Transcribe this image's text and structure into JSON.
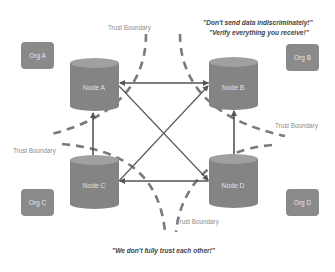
{
  "colors": {
    "node_body": "#848484",
    "node_top": "#a0a0a0",
    "org_fill": "#8a8a8a",
    "arrow": "#555555",
    "boundary_dash": "#7a7a7a",
    "label_text": "#8c8c8c",
    "quote_text": "#444444"
  },
  "nodes": [
    {
      "id": "A",
      "label": "Node A"
    },
    {
      "id": "B",
      "label": "Node B"
    },
    {
      "id": "C",
      "label": "Node C"
    },
    {
      "id": "D",
      "label": "Node D"
    }
  ],
  "orgs": [
    {
      "id": "A",
      "label": "Org A"
    },
    {
      "id": "B",
      "label": "Org B"
    },
    {
      "id": "C",
      "label": "Org C"
    },
    {
      "id": "D",
      "label": "Org D"
    }
  ],
  "boundaries": [
    {
      "position": "top",
      "label": "Trust Boundary"
    },
    {
      "position": "left",
      "label": "Trust Boundary"
    },
    {
      "position": "right",
      "label": "Trust Boundary"
    },
    {
      "position": "bottom",
      "label": "Trust Boundary"
    }
  ],
  "quotes": {
    "top_line1": "\"Don't send data indiscriminately!\"",
    "top_line2": "\"Verify everything you receive!\"",
    "bottom": "\"We don't fully trust each other!\""
  },
  "edges": [
    {
      "from": "B",
      "to": "A",
      "type": "arrow"
    },
    {
      "from": "C",
      "to": "A",
      "type": "arrow"
    },
    {
      "from": "A",
      "to": "D",
      "type": "line"
    },
    {
      "from": "C",
      "to": "B",
      "type": "arrow"
    },
    {
      "from": "D",
      "to": "B",
      "type": "arrow"
    },
    {
      "from": "D",
      "to": "C",
      "type": "arrow"
    }
  ]
}
